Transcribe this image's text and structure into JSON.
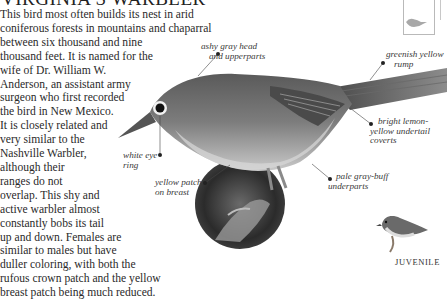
{
  "title": "VIRGINIA'S WARBLER",
  "body_lines": [
    "This bird most often builds its nest in arid",
    "coniferous forests in mountains and chaparral",
    "between six thousand and nine",
    "thousand feet. It is named for the",
    "wife of Dr. William W.",
    "Anderson, an assistant army",
    "surgeon who first recorded",
    "the bird in New Mexico.",
    "It is closely related and",
    "very similar to the",
    "Nashville Warbler,",
    "although their",
    "ranges do not",
    "overlap. This shy and",
    "active warbler almost",
    "constantly bobs its tail",
    "up and down. Females are",
    "similar to males but have",
    "duller coloring, with both the",
    "rufous crown patch and the yellow",
    "breast patch being much reduced."
  ],
  "annotations": {
    "head": [
      "ashy gray head",
      "and upperparts"
    ],
    "rump": [
      "greenish yellow",
      "rump"
    ],
    "undertail": [
      "bright lemon-",
      "yellow undertail",
      "coverts"
    ],
    "underparts": [
      "pale gray-buff",
      "underparts"
    ],
    "eye_ring": [
      "white eye",
      "ring"
    ],
    "breast": [
      "yellow patch",
      "on breast"
    ]
  },
  "juvenile_label": "JUVENILE",
  "colors": {
    "text": "#2a2a2a",
    "bird_gray": "#6f6f6f",
    "map_border": "#b9b9b9"
  }
}
